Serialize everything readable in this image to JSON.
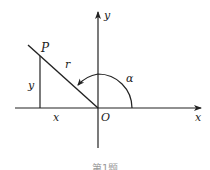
{
  "diagram": {
    "type": "trigonometry-unit-diagram",
    "axes": {
      "x_label": "x",
      "y_label": "y",
      "origin_label": "O"
    },
    "point": {
      "label": "P"
    },
    "segments": {
      "hypotenuse_label": "r",
      "vertical_leg_label": "y",
      "horizontal_leg_label": "x"
    },
    "angle": {
      "label": "α"
    },
    "caption": "第1题"
  },
  "colors": {
    "stroke": "#222222",
    "background": "#ffffff"
  }
}
